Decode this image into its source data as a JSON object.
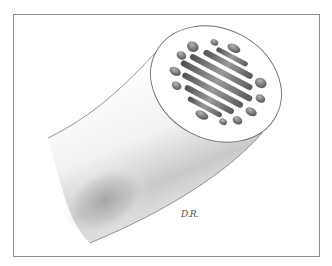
{
  "illustration": {
    "subject": "cross-section of a cylindrical fiber with internal folded structures",
    "signature": "D.R.",
    "colors": {
      "frame_border": "#8f8f8f",
      "background": "#ffffff",
      "shading_dark": "#6b6b6b",
      "shading_mid": "#a8a8a8",
      "shading_light": "#e6e6e6",
      "outline": "#7a7a7a"
    }
  }
}
